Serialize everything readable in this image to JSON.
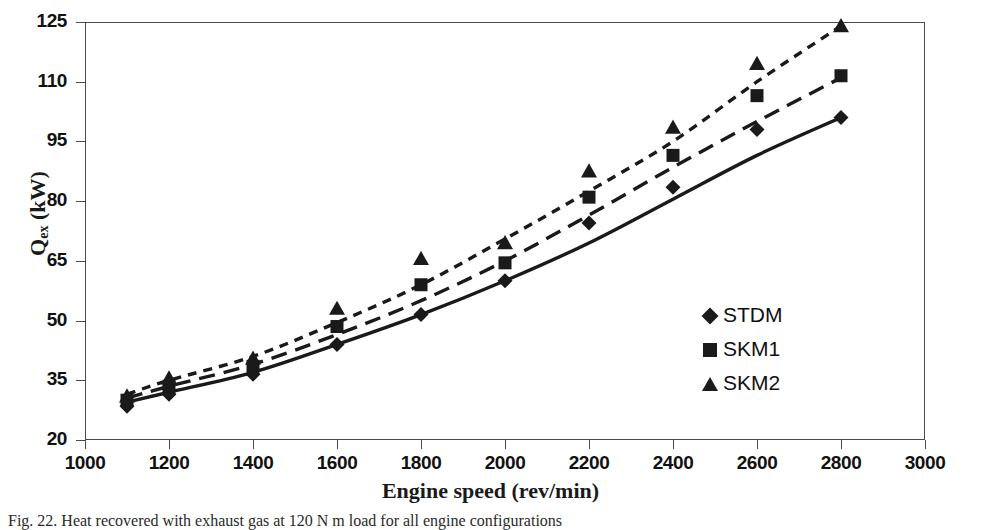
{
  "chart_data": {
    "type": "line",
    "title": "",
    "xlabel": "Engine speed (rev/min)",
    "ylabel": "Q_ex (kW)",
    "ylabel_base": "Q",
    "ylabel_sub": "ex",
    "ylabel_unit": " (kW)",
    "xlim": [
      1000,
      3000
    ],
    "ylim": [
      20,
      125
    ],
    "xticks": [
      1000,
      1200,
      1400,
      1600,
      1800,
      2000,
      2200,
      2400,
      2600,
      2800,
      3000
    ],
    "yticks": [
      20,
      35,
      50,
      65,
      80,
      95,
      110,
      125
    ],
    "grid": false,
    "legend_position": "inside-right",
    "x": [
      1100,
      1200,
      1400,
      1600,
      1800,
      2000,
      2200,
      2400,
      2600,
      2800
    ],
    "series": [
      {
        "name": "STDM",
        "marker": "diamond",
        "line_style": "solid",
        "values": [
          29.5,
          32.0,
          37.0,
          44.0,
          51.5,
          60.0,
          69.5,
          80.5,
          91.5,
          101.0
        ]
      },
      {
        "name": "SKM1",
        "marker": "square",
        "line_style": "long-dash",
        "values": [
          30.5,
          33.5,
          39.0,
          46.5,
          55.0,
          65.0,
          76.5,
          88.5,
          100.0,
          111.0
        ]
      },
      {
        "name": "SKM2",
        "marker": "triangle",
        "line_style": "short-dash",
        "values": [
          31.5,
          35.0,
          41.0,
          49.5,
          59.0,
          70.5,
          82.5,
          95.0,
          110.0,
          124.0
        ]
      }
    ],
    "markers": {
      "STDM": [
        {
          "x": 1100,
          "y": 28.5
        },
        {
          "x": 1200,
          "y": 31.5
        },
        {
          "x": 1400,
          "y": 36.5
        },
        {
          "x": 1600,
          "y": 44.0
        },
        {
          "x": 1800,
          "y": 51.5
        },
        {
          "x": 2000,
          "y": 60.0
        },
        {
          "x": 2200,
          "y": 74.5
        },
        {
          "x": 2400,
          "y": 83.5
        },
        {
          "x": 2600,
          "y": 98.0
        },
        {
          "x": 2800,
          "y": 101.0
        }
      ],
      "SKM1": [
        {
          "x": 1100,
          "y": 30.0
        },
        {
          "x": 1200,
          "y": 33.5
        },
        {
          "x": 1400,
          "y": 38.5
        },
        {
          "x": 1600,
          "y": 48.5
        },
        {
          "x": 1800,
          "y": 59.0
        },
        {
          "x": 2000,
          "y": 64.5
        },
        {
          "x": 2200,
          "y": 81.0
        },
        {
          "x": 2400,
          "y": 91.5
        },
        {
          "x": 2600,
          "y": 106.5
        },
        {
          "x": 2800,
          "y": 111.5
        }
      ],
      "SKM2": [
        {
          "x": 1100,
          "y": 31.0
        },
        {
          "x": 1200,
          "y": 35.5
        },
        {
          "x": 1400,
          "y": 40.5
        },
        {
          "x": 1600,
          "y": 53.0
        },
        {
          "x": 1800,
          "y": 65.5
        },
        {
          "x": 2000,
          "y": 69.5
        },
        {
          "x": 2200,
          "y": 87.5
        },
        {
          "x": 2400,
          "y": 98.5
        },
        {
          "x": 2600,
          "y": 114.5
        },
        {
          "x": 2800,
          "y": 124.0
        }
      ]
    }
  },
  "legend": {
    "items": [
      {
        "label": "STDM",
        "marker": "diamond"
      },
      {
        "label": "SKM1",
        "marker": "square"
      },
      {
        "label": "SKM2",
        "marker": "triangle"
      }
    ]
  },
  "caption": {
    "text": "Fig. 22. Heat recovered with exhaust gas at 120 N m load for all engine configurations"
  }
}
